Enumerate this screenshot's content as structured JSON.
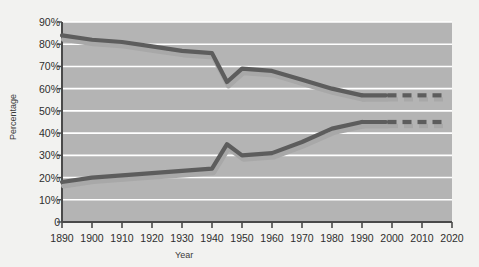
{
  "chart_data": {
    "type": "line",
    "title": "",
    "xlabel": "Year",
    "ylabel": "Percentage",
    "xlim": [
      1890,
      2020
    ],
    "ylim": [
      0,
      90
    ],
    "grid": true,
    "legend_position": "inline-annotation",
    "x_ticks": [
      1890,
      1900,
      1910,
      1920,
      1930,
      1940,
      1950,
      1960,
      1970,
      1980,
      1990,
      2000,
      2010,
      2020
    ],
    "y_ticks": [
      0,
      10,
      20,
      30,
      40,
      50,
      60,
      70,
      80,
      90
    ],
    "y_tick_labels": [
      "0",
      "10%",
      "20%",
      "30%",
      "40%",
      "50%",
      "60%",
      "70%",
      "80%",
      "90%"
    ],
    "series": [
      {
        "name": "Men",
        "color": "#5d5d5d",
        "shadow_color": "#a8a8a8",
        "x": [
          1890,
          1900,
          1910,
          1920,
          1930,
          1940,
          1945,
          1950,
          1960,
          1970,
          1980,
          1990
        ],
        "values": [
          84,
          82,
          81,
          79,
          77,
          76,
          63,
          69,
          68,
          64,
          60,
          57
        ],
        "projection_x": [
          2000,
          2005,
          2010,
          2015
        ],
        "projection_values": [
          57,
          57,
          57,
          57
        ],
        "projection_style": "dashed"
      },
      {
        "name": "Women",
        "color": "#5d5d5d",
        "shadow_color": "#a8a8a8",
        "x": [
          1890,
          1900,
          1910,
          1920,
          1930,
          1940,
          1945,
          1950,
          1960,
          1970,
          1980,
          1990
        ],
        "values": [
          18,
          20,
          21,
          22,
          23,
          24,
          35,
          30,
          31,
          36,
          42,
          45
        ],
        "projection_x": [
          2000,
          2005,
          2010,
          2015
        ],
        "projection_values": [
          45,
          45,
          45,
          45
        ],
        "projection_style": "dashed"
      }
    ],
    "annotations": [
      {
        "text": "Men",
        "x": 1970,
        "y": 66
      },
      {
        "text": "Women",
        "x": 1957,
        "y": 48
      }
    ]
  },
  "style": {
    "plot_background": "#b4b4b4",
    "page_background": "#f2f2f0",
    "gridline_color": "#ffffff",
    "axis_color": "#4a4a4a",
    "line_color": "#5d5d5d",
    "shadow_color": "#a8a8a8"
  }
}
